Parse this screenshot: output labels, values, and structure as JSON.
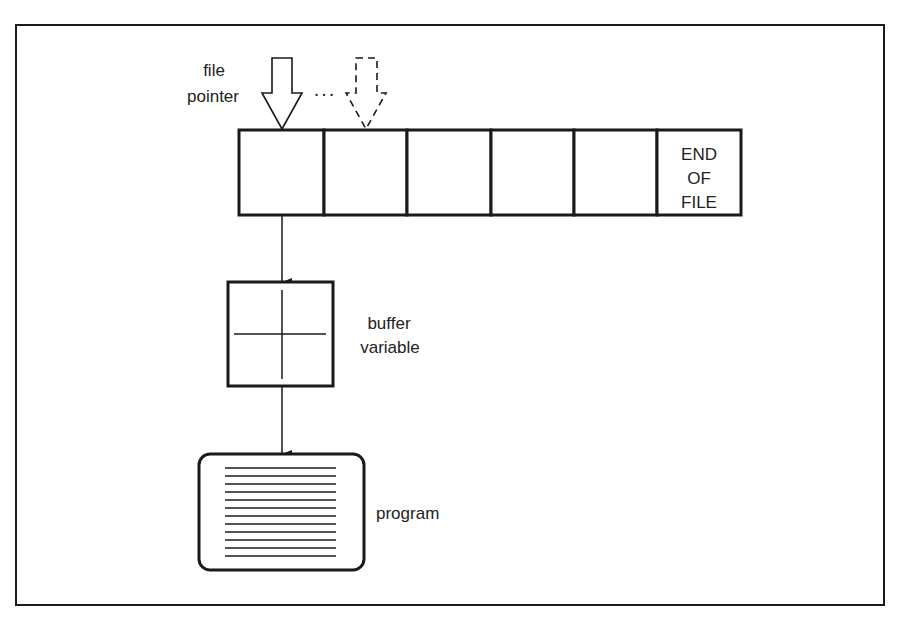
{
  "diagram": {
    "type": "file-buffer-schematic",
    "colors": {
      "stroke": "#1a1a1a",
      "text": "#222222",
      "background": "#ffffff"
    },
    "labels": {
      "file_pointer_line1": "file",
      "file_pointer_line2": "pointer",
      "ellipsis": "...",
      "end_of_file_line1": "END",
      "end_of_file_line2": "OF",
      "end_of_file_line3": "FILE",
      "buffer_variable_line1": "buffer",
      "buffer_variable_line2": "variable",
      "program": "program"
    },
    "file": {
      "cell_count": 6,
      "cells": [
        "",
        "",
        "",
        "",
        "",
        "END OF FILE"
      ]
    },
    "pointers": [
      {
        "style": "solid",
        "target_cell": 0
      },
      {
        "style": "dashed",
        "target_cell": 1
      }
    ],
    "flow": [
      "file",
      "buffer variable",
      "program"
    ],
    "program_listing_lines": 12
  }
}
